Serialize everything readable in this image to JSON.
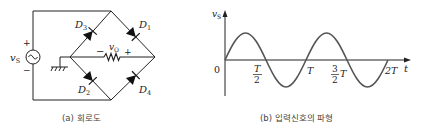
{
  "panels": {
    "circuit": {
      "caption": "(a) 회로도",
      "source_label": "v",
      "source_sub": "S",
      "source_plus": "+",
      "source_minus": "−",
      "output_label": "v",
      "output_sub": "O",
      "output_minus": "−",
      "output_plus": "+",
      "diodes": [
        {
          "name": "D",
          "sub": "3",
          "position": "upper-left"
        },
        {
          "name": "D",
          "sub": "1",
          "position": "upper-right"
        },
        {
          "name": "D",
          "sub": "2",
          "position": "lower-left"
        },
        {
          "name": "D",
          "sub": "4",
          "position": "lower-right"
        }
      ]
    },
    "waveform": {
      "caption": "(b) 입력신호의 파형",
      "y_axis_label": "v",
      "y_axis_sub": "S",
      "x_axis_label": "t",
      "origin_label": "0",
      "ticks": {
        "half_T_num": "T",
        "half_T_den": "2",
        "T": "T",
        "three_half_num": "3",
        "three_half_den": "2",
        "three_half_T": "T",
        "two_T": "2T"
      }
    }
  },
  "colors": {
    "line": "#222222",
    "wave": "#555555",
    "caption": "#444444"
  }
}
